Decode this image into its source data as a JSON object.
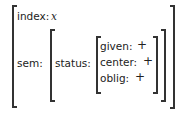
{
  "avm": {
    "index": {
      "label": "index:",
      "value": "x"
    },
    "sem": {
      "label": "sem:",
      "status": {
        "label": "status:",
        "features": [
          {
            "label": "given:",
            "value": "+"
          },
          {
            "label": "center:",
            "value": "+"
          },
          {
            "label": "oblig:",
            "value": "+"
          }
        ]
      }
    }
  }
}
